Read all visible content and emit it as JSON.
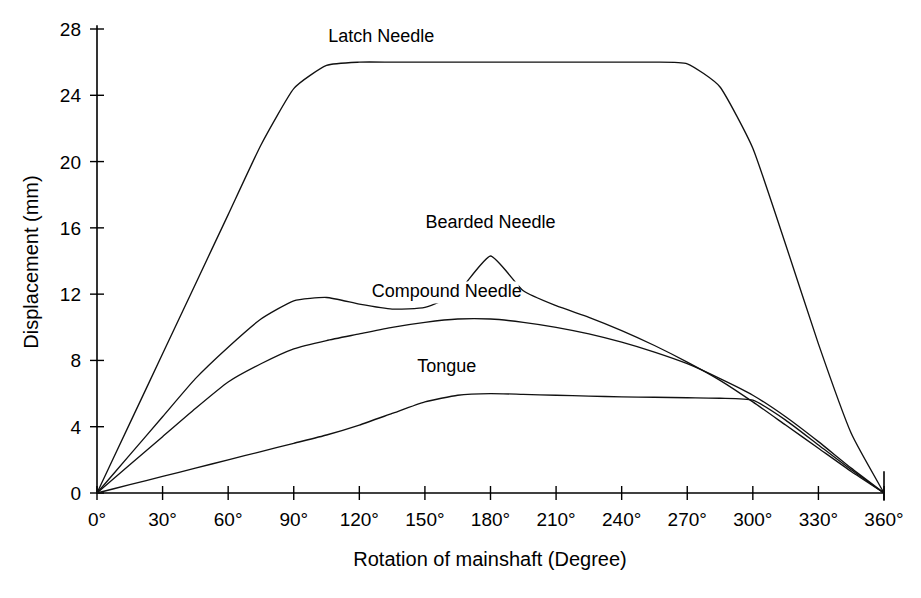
{
  "chart_data": {
    "type": "line",
    "title": "",
    "xlabel": "Rotation of mainshaft (Degree)",
    "ylabel": "Displacement (mm)",
    "xlim": [
      0,
      360
    ],
    "ylim": [
      0,
      28
    ],
    "grid": false,
    "legend_position": "inline-labels",
    "x_ticks": [
      0,
      30,
      60,
      90,
      120,
      150,
      180,
      210,
      240,
      270,
      300,
      330,
      360
    ],
    "x_tick_labels": [
      "0°",
      "30°",
      "60°",
      "90°",
      "120°",
      "150°",
      "180°",
      "210°",
      "240°",
      "270°",
      "300°",
      "330°",
      "360°"
    ],
    "y_ticks": [
      0,
      4,
      8,
      12,
      16,
      20,
      24,
      28
    ],
    "y_tick_labels": [
      "0",
      "4",
      "8",
      "12",
      "16",
      "20",
      "24",
      "28"
    ],
    "x": [
      0,
      15,
      30,
      45,
      60,
      75,
      90,
      105,
      120,
      135,
      150,
      165,
      180,
      195,
      210,
      225,
      240,
      255,
      270,
      285,
      300,
      315,
      330,
      345,
      360
    ],
    "series": [
      {
        "name": "Latch Needle",
        "label": "Latch Needle",
        "label_x": 130,
        "label_y": 27.2,
        "values": [
          0,
          4.2,
          8.4,
          12.6,
          16.8,
          21.0,
          24.4,
          25.8,
          26.0,
          26.0,
          26.0,
          26.0,
          26.0,
          26.0,
          26.0,
          26.0,
          26.0,
          26.0,
          25.9,
          24.5,
          20.8,
          15.0,
          9.0,
          3.6,
          0
        ]
      },
      {
        "name": "Bearded Needle",
        "label": "Bearded Needle",
        "label_x": 180,
        "label_y": 16.0,
        "values": [
          0,
          2.3,
          4.6,
          6.9,
          8.8,
          10.5,
          11.6,
          11.8,
          11.4,
          11.1,
          11.2,
          12.1,
          14.3,
          12.2,
          11.3,
          10.6,
          9.8,
          8.9,
          7.9,
          6.8,
          5.5,
          4.1,
          2.7,
          1.3,
          0
        ]
      },
      {
        "name": "Compound Needle",
        "label": "Compound Needle",
        "label_x": 160,
        "label_y": 11.8,
        "values": [
          0,
          1.7,
          3.4,
          5.1,
          6.7,
          7.8,
          8.7,
          9.2,
          9.6,
          10.0,
          10.3,
          10.5,
          10.5,
          10.3,
          10.0,
          9.6,
          9.1,
          8.5,
          7.8,
          6.9,
          5.9,
          4.6,
          3.1,
          1.5,
          0
        ]
      },
      {
        "name": "Tongue",
        "label": "Tongue",
        "label_x": 160,
        "label_y": 7.3,
        "values": [
          0,
          0.5,
          1.0,
          1.5,
          2.0,
          2.5,
          3.0,
          3.5,
          4.1,
          4.8,
          5.5,
          5.9,
          6.0,
          5.95,
          5.9,
          5.85,
          5.8,
          5.78,
          5.75,
          5.72,
          5.6,
          4.4,
          2.9,
          1.4,
          0
        ]
      }
    ]
  }
}
